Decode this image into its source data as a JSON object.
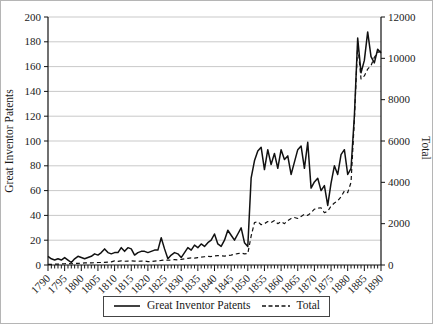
{
  "chart_data": {
    "type": "line",
    "title": "",
    "background": "#ffffff",
    "grid": "horizontal",
    "colors": {
      "line": "#111111",
      "grid": "#c9c9c9",
      "axis": "#111111",
      "text": "#1a1a1a"
    },
    "x_axis": {
      "start": 1790,
      "end": 1890,
      "minor_tick_step": 1,
      "major_tick_step": 5,
      "major_labels": [
        "1790",
        "1795",
        "1800",
        "1805",
        "1810",
        "1815",
        "1820",
        "1825",
        "1830",
        "1835",
        "1840",
        "1845",
        "1850",
        "1855",
        "1860",
        "1865",
        "1870",
        "1875",
        "1880",
        "1885",
        "1890"
      ]
    },
    "left_axis": {
      "label": "Great Inventor Patents",
      "min": 0,
      "max": 200,
      "step": 20,
      "ticks": [
        0,
        20,
        40,
        60,
        80,
        100,
        120,
        140,
        160,
        180,
        200
      ]
    },
    "right_axis": {
      "label": "Total",
      "min": 0,
      "max": 12000,
      "step": 2000,
      "ticks": [
        0,
        2000,
        4000,
        6000,
        8000,
        10000,
        12000
      ]
    },
    "legend": {
      "position": "bottom-center",
      "entries": [
        {
          "label": "Great Inventor Patents",
          "style": "solid"
        },
        {
          "label": "Total",
          "style": "dashed"
        }
      ]
    },
    "series": [
      {
        "name": "Great Inventor Patents",
        "axis": "left",
        "style": "solid",
        "values": [
          7,
          5,
          4,
          5,
          4,
          6,
          4,
          2,
          5,
          7,
          6,
          5,
          6,
          7,
          9,
          8,
          10,
          13,
          10,
          9,
          10,
          10,
          14,
          11,
          14,
          13,
          8,
          10,
          11,
          11,
          10,
          11,
          12,
          12,
          22,
          13,
          5,
          8,
          10,
          9,
          6,
          10,
          14,
          12,
          16,
          14,
          17,
          15,
          18,
          20,
          25,
          17,
          15,
          20,
          28,
          24,
          20,
          25,
          30,
          18,
          15,
          70,
          84,
          92,
          95,
          77,
          93,
          81,
          90,
          78,
          93,
          85,
          88,
          73,
          83,
          93,
          96,
          78,
          99,
          62,
          67,
          70,
          60,
          64,
          48,
          66,
          80,
          73,
          89,
          93,
          73,
          78,
          120,
          183,
          155,
          165,
          188,
          168,
          163,
          174,
          171
        ]
      },
      {
        "name": "Total",
        "axis": "right",
        "style": "dashed",
        "values": [
          30,
          35,
          40,
          45,
          50,
          60,
          70,
          60,
          70,
          80,
          90,
          100,
          110,
          100,
          110,
          120,
          120,
          130,
          140,
          150,
          200,
          180,
          200,
          180,
          190,
          200,
          190,
          180,
          190,
          200,
          160,
          170,
          190,
          200,
          220,
          250,
          230,
          240,
          260,
          250,
          270,
          300,
          320,
          340,
          330,
          360,
          380,
          400,
          420,
          410,
          440,
          450,
          440,
          430,
          460,
          480,
          520,
          550,
          580,
          540,
          550,
          1400,
          2050,
          2100,
          1950,
          2000,
          2100,
          2050,
          2150,
          2000,
          2100,
          2000,
          2150,
          2250,
          2300,
          2250,
          2350,
          2450,
          2400,
          2530,
          2700,
          2750,
          2770,
          2530,
          2600,
          2850,
          3000,
          3100,
          3300,
          3580,
          3500,
          4000,
          7000,
          10700,
          9000,
          9150,
          9480,
          9650,
          10050,
          10290,
          10350
        ]
      }
    ]
  }
}
